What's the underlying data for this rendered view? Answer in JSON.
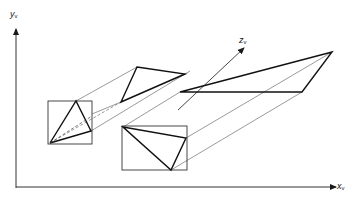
{
  "diagram": {
    "type": "parallel projection of a triangle onto three view planes",
    "axes": {
      "y": {
        "label": "y",
        "subscript": "v"
      },
      "x": {
        "label": "x",
        "subscript": "v"
      },
      "z": {
        "label": "z",
        "subscript": "v"
      }
    },
    "colors": {
      "stroke": "#1a1a1a",
      "thin": "#555555",
      "background": "#ffffff"
    }
  }
}
